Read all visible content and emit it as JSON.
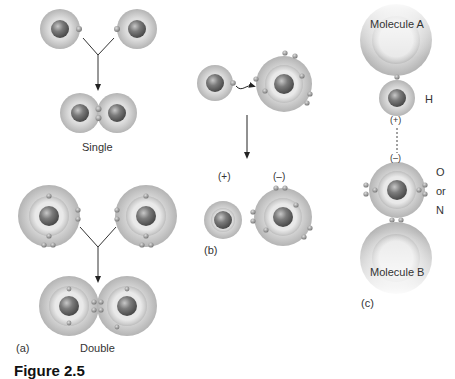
{
  "figure": {
    "caption_fragment": "Figure 2.5",
    "panels": {
      "a": {
        "label": "(a)",
        "single": {
          "label": "Single"
        },
        "double": {
          "label": "Double"
        }
      },
      "b": {
        "label": "(b)",
        "cation_charge": "(+)",
        "anion_charge": "(–)"
      },
      "c": {
        "label": "(c)",
        "molecule_a": "Molecule A",
        "molecule_b": "Molecule B",
        "hydrogen": "H",
        "partial_positive": "(+)",
        "partial_negative": "(–)",
        "acceptor_o": "O",
        "acceptor_or": "or",
        "acceptor_n": "N"
      }
    },
    "colors": {
      "shell_outer": "#c8c8c8",
      "shell_inner": "#e6e6e6",
      "nucleus": "#7a7a7a",
      "electron": "#9a9a9a",
      "arrow": "#222222"
    }
  }
}
